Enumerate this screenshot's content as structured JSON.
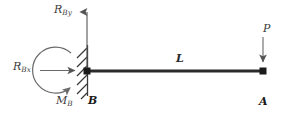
{
  "diagram": {
    "kind": "free-body-diagram",
    "colors": {
      "beam": "#2b2b2b",
      "node": "#1a1a1a",
      "arrow": "#555555",
      "support": "#3a3a3a",
      "moment": "#6a6a6a",
      "label": "#3a3a3a",
      "background": "#ffffff"
    },
    "labels": {
      "reaction_vertical": {
        "base": "R",
        "sub": "By",
        "full": "R_By"
      },
      "reaction_horizontal": {
        "base": "R",
        "sub": "Bx",
        "full": "R_Bx"
      },
      "reaction_moment": {
        "base": "M",
        "sub": "B",
        "full": "M_B"
      },
      "support_point": "B",
      "free_point": "A",
      "beam_length": "L",
      "applied_load": "P"
    },
    "geometry": {
      "beam": {
        "x1": 86,
        "y1": 71,
        "x2": 264,
        "y2": 71,
        "thickness": 3
      },
      "node_b": {
        "cx": 87,
        "cy": 71,
        "size": 7
      },
      "node_a": {
        "cx": 263,
        "cy": 71,
        "size": 7
      },
      "support_wall": {
        "x": 87,
        "y_top": 45,
        "y_bottom": 96
      },
      "hatch_count": 6,
      "arrow_rby": {
        "x": 87,
        "y_tail": 68,
        "y_head": 6
      },
      "arrow_rbx": {
        "y": 70,
        "x_tail": 40,
        "x_head": 82
      },
      "arrow_p": {
        "x": 263,
        "y_tail": 37,
        "y_head": 66
      },
      "moment_arc": {
        "cx": 78,
        "cy": 71,
        "r": 23,
        "direction": "clockwise"
      }
    }
  }
}
